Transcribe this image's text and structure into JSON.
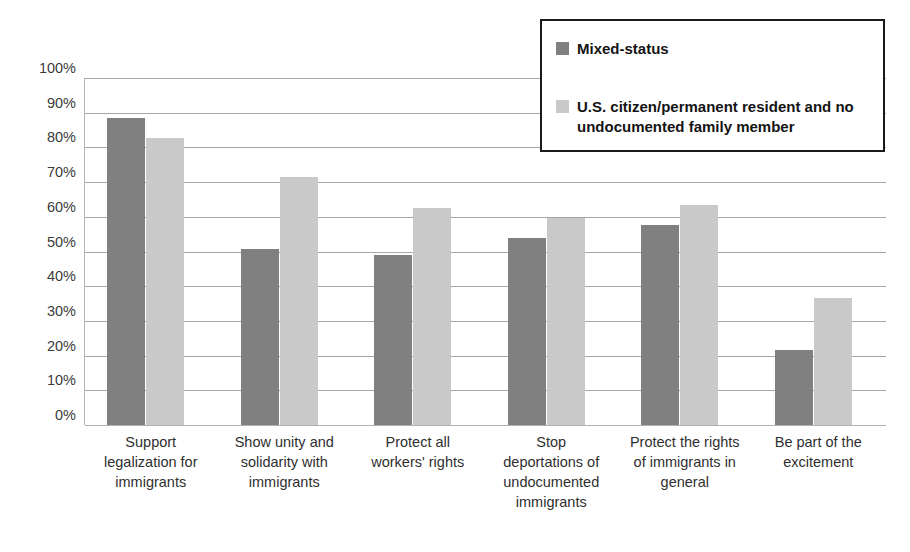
{
  "chart_data": {
    "type": "bar",
    "title": "",
    "subtitle": "",
    "xlabel": "",
    "ylabel": "",
    "ylim": [
      0,
      100
    ],
    "y_tick_labels": [
      "100%",
      "90%",
      "80%",
      "70%",
      "60%",
      "50%",
      "40%",
      "30%",
      "20%",
      "10%",
      "0%"
    ],
    "y_tick_values": [
      100,
      90,
      80,
      70,
      60,
      50,
      40,
      30,
      20,
      10,
      0
    ],
    "grid": true,
    "legend_position": "top-right",
    "value_suffix": "%",
    "categories": [
      "Support legalization for immigrants",
      "Show unity and solidarity with immigrants",
      "Protect all workers' rights",
      "Stop deportations of undocumented immigrants",
      "Protect the rights of immigrants in general",
      "Be part of the excitement"
    ],
    "category_lines": [
      [
        "Support",
        "legalization for",
        "immigrants"
      ],
      [
        "Show unity and",
        "solidarity with",
        "immigrants"
      ],
      [
        "Protect all",
        "workers' rights"
      ],
      [
        "Stop",
        "deportations of",
        "undocumented",
        "immigrants"
      ],
      [
        "Protect the rights",
        "of immigrants in",
        "general"
      ],
      [
        "Be part of the",
        "excitement"
      ]
    ],
    "series": [
      {
        "name": "Mixed-status",
        "color": "#808080",
        "values": [
          88.5,
          50.8,
          48.9,
          53.8,
          57.7,
          21.6
        ]
      },
      {
        "name": "U.S. citizen/permanent resident and no undocumented family member",
        "color": "#c9c9c9",
        "values": [
          82.7,
          71.5,
          62.5,
          59.7,
          63.4,
          36.7
        ]
      }
    ]
  },
  "legend": {
    "entries": [
      {
        "label": "Mixed-status",
        "color": "#808080"
      },
      {
        "label": "U.S. citizen/permanent resident and no undocumented family member",
        "color": "#c9c9c9"
      }
    ]
  }
}
